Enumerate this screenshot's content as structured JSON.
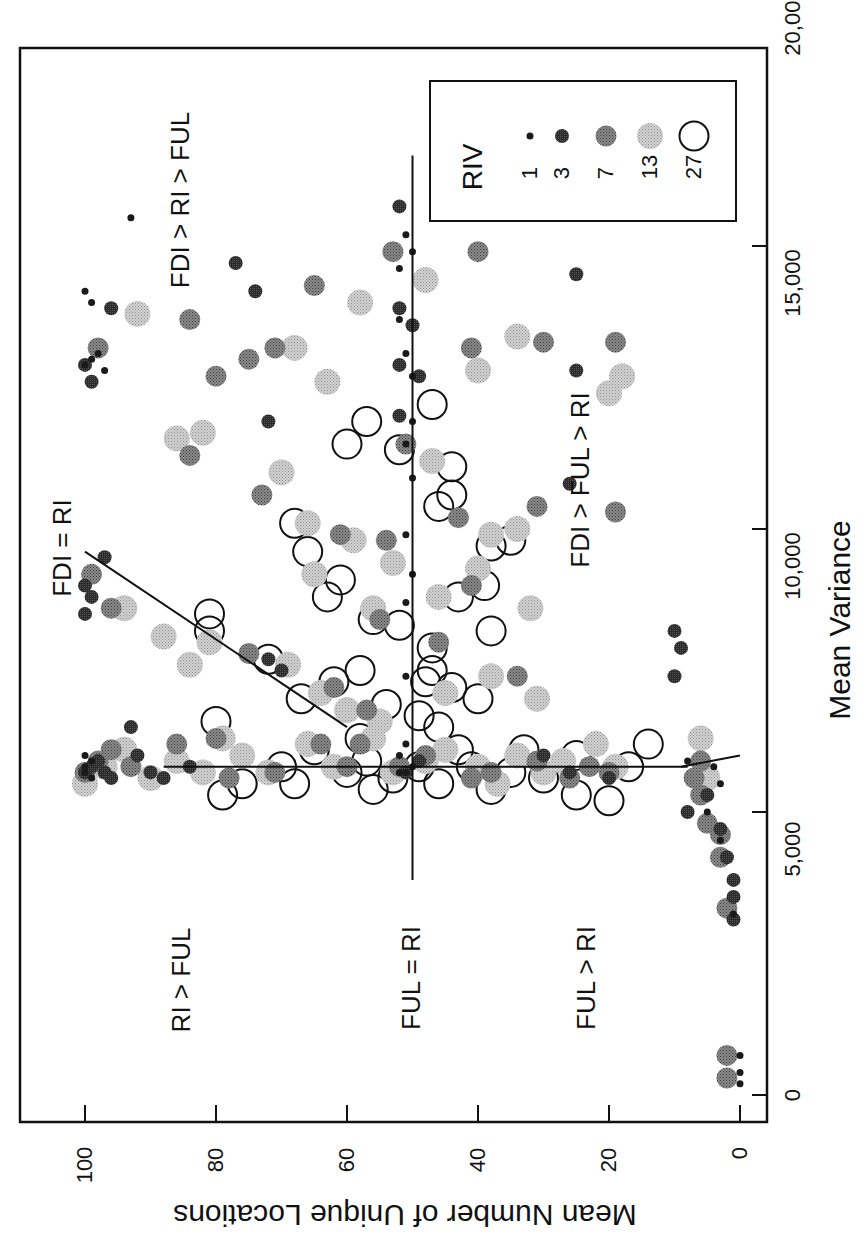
{
  "chart_data": {
    "type": "scatter",
    "orientation": "rotated-90-ccw",
    "title": "",
    "xlabel": "Mean Variance",
    "ylabel": "Mean Number of Unique Locations",
    "xlim": [
      -500,
      20000
    ],
    "ylim": [
      -5,
      105
    ],
    "xticks": [
      "0",
      "5,000",
      "10,000",
      "15,000",
      "20,000"
    ],
    "xtick_values": [
      0,
      5000,
      10000,
      15000,
      20000
    ],
    "yticks": [
      "0",
      "20",
      "40",
      "60",
      "80",
      "100"
    ],
    "ytick_values": [
      0,
      20,
      40,
      60,
      80,
      100
    ],
    "grid": false,
    "legend": {
      "title": "RIV",
      "position": "upper-right",
      "entries": [
        {
          "label": "1",
          "marker": "tiny-dark-dot",
          "color": "#1a1a1a"
        },
        {
          "label": "3",
          "marker": "small-dark-dot",
          "color": "#333333"
        },
        {
          "label": "7",
          "marker": "medium-gray-dot",
          "color": "#6a6a6a"
        },
        {
          "label": "13",
          "marker": "large-light-gray-dot",
          "color": "#b4b4b4"
        },
        {
          "label": "27",
          "marker": "large-open-circle",
          "color": "#111111"
        }
      ]
    },
    "annotations": [
      {
        "text": "FDI > RI > FUL",
        "variance": 14700,
        "locations": 90
      },
      {
        "text": "FDI = RI",
        "variance": 9000,
        "locations": 103
      },
      {
        "text": "FDI > FUL > RI",
        "variance": 10500,
        "locations": 25
      },
      {
        "text": "RI > FUL",
        "variance": 2800,
        "locations": 83
      },
      {
        "text": "FUL = RI",
        "variance": 2800,
        "locations": 50
      },
      {
        "text": "FUL > RI",
        "variance": 2800,
        "locations": 22
      }
    ],
    "reference_lines": [
      {
        "name": "FUL = RI",
        "from": {
          "variance": 3800,
          "locations": 50
        },
        "to": {
          "variance": 16600,
          "locations": 50
        }
      },
      {
        "name": "FDI = RI vertical",
        "from": {
          "variance": 6000,
          "locations": 0
        },
        "to": {
          "variance": 5800,
          "locations": 9
        }
      },
      {
        "name": "FDI boundary",
        "from": {
          "variance": 5800,
          "locations": 8
        },
        "to": {
          "variance": 5800,
          "locations": 88
        }
      },
      {
        "name": "FDI = RI diagonal",
        "from": {
          "variance": 6500,
          "locations": 60
        },
        "to": {
          "variance": 9600,
          "locations": 100
        }
      }
    ],
    "series": [
      {
        "name": "RIV 1",
        "riv": 1,
        "points": [
          [
            200,
            0
          ],
          [
            400,
            0
          ],
          [
            700,
            0
          ],
          [
            3200,
            1
          ],
          [
            4500,
            3
          ],
          [
            5000,
            5
          ],
          [
            5700,
            100
          ],
          [
            5800,
            100
          ],
          [
            5900,
            99
          ],
          [
            6000,
            100
          ],
          [
            5600,
            99
          ],
          [
            5700,
            52
          ],
          [
            5800,
            50
          ],
          [
            5700,
            51
          ],
          [
            6000,
            52
          ],
          [
            12900,
            100
          ],
          [
            13000,
            99
          ],
          [
            13100,
            98
          ],
          [
            12800,
            97
          ],
          [
            14000,
            99
          ],
          [
            14200,
            100
          ],
          [
            15500,
            93
          ],
          [
            14600,
            52
          ],
          [
            15200,
            51
          ],
          [
            14900,
            50
          ],
          [
            13700,
            52
          ],
          [
            13100,
            51
          ],
          [
            12700,
            50
          ],
          [
            11900,
            50
          ],
          [
            11500,
            51
          ],
          [
            10900,
            50
          ],
          [
            9900,
            51
          ],
          [
            9200,
            50
          ],
          [
            8700,
            51
          ],
          [
            7400,
            51
          ],
          [
            6200,
            51
          ],
          [
            5900,
            8
          ],
          [
            5500,
            3
          ],
          [
            5800,
            4
          ]
        ]
      },
      {
        "name": "RIV 3",
        "riv": 3,
        "points": [
          [
            3100,
            1
          ],
          [
            3500,
            1
          ],
          [
            3800,
            1
          ],
          [
            4200,
            2
          ],
          [
            4700,
            3
          ],
          [
            5000,
            8
          ],
          [
            5300,
            5
          ],
          [
            5700,
            100
          ],
          [
            5800,
            99
          ],
          [
            5900,
            98
          ],
          [
            5700,
            97
          ],
          [
            5600,
            96
          ],
          [
            6000,
            92
          ],
          [
            6500,
            93
          ],
          [
            5700,
            90
          ],
          [
            5600,
            88
          ],
          [
            5800,
            84
          ],
          [
            5700,
            51
          ],
          [
            5900,
            49
          ],
          [
            8200,
            10
          ],
          [
            7900,
            9
          ],
          [
            7400,
            10
          ],
          [
            12900,
            100
          ],
          [
            12600,
            99
          ],
          [
            13900,
            96
          ],
          [
            14700,
            77
          ],
          [
            14200,
            74
          ],
          [
            11900,
            72
          ],
          [
            12000,
            52
          ],
          [
            12700,
            49
          ],
          [
            13600,
            50
          ],
          [
            15700,
            52
          ],
          [
            13900,
            52
          ],
          [
            12900,
            52
          ],
          [
            10800,
            26
          ],
          [
            12800,
            25
          ],
          [
            14500,
            25
          ],
          [
            9000,
            100
          ],
          [
            8800,
            99
          ],
          [
            8500,
            100
          ],
          [
            9500,
            97
          ],
          [
            7700,
            72
          ],
          [
            7500,
            70
          ],
          [
            6000,
            30
          ],
          [
            5700,
            26
          ],
          [
            5600,
            20
          ]
        ]
      },
      {
        "name": "RIV 7",
        "riv": 7,
        "points": [
          [
            300,
            2
          ],
          [
            700,
            2
          ],
          [
            3300,
            2
          ],
          [
            4200,
            3
          ],
          [
            4600,
            3
          ],
          [
            4800,
            5
          ],
          [
            5300,
            6
          ],
          [
            5600,
            7
          ],
          [
            5900,
            6
          ],
          [
            5700,
            100
          ],
          [
            5900,
            98
          ],
          [
            6100,
            96
          ],
          [
            5800,
            93
          ],
          [
            6200,
            86
          ],
          [
            6300,
            80
          ],
          [
            5600,
            78
          ],
          [
            5700,
            71
          ],
          [
            6200,
            64
          ],
          [
            5800,
            60
          ],
          [
            6200,
            58
          ],
          [
            5800,
            52
          ],
          [
            6000,
            48
          ],
          [
            5600,
            41
          ],
          [
            5700,
            38
          ],
          [
            5900,
            31
          ],
          [
            5600,
            26
          ],
          [
            5800,
            23
          ],
          [
            5700,
            20
          ],
          [
            9200,
            99
          ],
          [
            8600,
            96
          ],
          [
            7800,
            75
          ],
          [
            7200,
            62
          ],
          [
            6800,
            57
          ],
          [
            8000,
            46
          ],
          [
            8400,
            55
          ],
          [
            7400,
            34
          ],
          [
            9000,
            41
          ],
          [
            9900,
            61
          ],
          [
            10600,
            73
          ],
          [
            11300,
            84
          ],
          [
            11500,
            51
          ],
          [
            12700,
            80
          ],
          [
            13000,
            75
          ],
          [
            13200,
            71
          ],
          [
            13200,
            98
          ],
          [
            13700,
            84
          ],
          [
            14300,
            65
          ],
          [
            14900,
            53
          ],
          [
            13200,
            41
          ],
          [
            14900,
            40
          ],
          [
            13300,
            30
          ],
          [
            13300,
            19
          ],
          [
            10400,
            31
          ],
          [
            10300,
            19
          ],
          [
            10200,
            43
          ],
          [
            9800,
            54
          ]
        ]
      },
      {
        "name": "RIV 13",
        "riv": 13,
        "points": [
          [
            5500,
            100
          ],
          [
            5800,
            97
          ],
          [
            6100,
            94
          ],
          [
            5600,
            90
          ],
          [
            5900,
            86
          ],
          [
            5700,
            82
          ],
          [
            6300,
            79
          ],
          [
            6000,
            76
          ],
          [
            5700,
            72
          ],
          [
            6200,
            66
          ],
          [
            5800,
            62
          ],
          [
            6300,
            56
          ],
          [
            5700,
            53
          ],
          [
            5900,
            48
          ],
          [
            6100,
            45
          ],
          [
            5800,
            40
          ],
          [
            5500,
            37
          ],
          [
            6000,
            34
          ],
          [
            5700,
            30
          ],
          [
            5900,
            27
          ],
          [
            6200,
            22
          ],
          [
            5800,
            19
          ],
          [
            5600,
            5
          ],
          [
            6300,
            6
          ],
          [
            8600,
            94
          ],
          [
            8100,
            88
          ],
          [
            8000,
            81
          ],
          [
            7600,
            84
          ],
          [
            7600,
            69
          ],
          [
            7100,
            64
          ],
          [
            6800,
            60
          ],
          [
            6600,
            55
          ],
          [
            7100,
            45
          ],
          [
            7400,
            38
          ],
          [
            7000,
            31
          ],
          [
            8600,
            32
          ],
          [
            9300,
            40
          ],
          [
            9400,
            53
          ],
          [
            9800,
            59
          ],
          [
            10100,
            66
          ],
          [
            11000,
            70
          ],
          [
            11700,
            82
          ],
          [
            11600,
            86
          ],
          [
            11200,
            47
          ],
          [
            12600,
            63
          ],
          [
            13200,
            68
          ],
          [
            13800,
            92
          ],
          [
            14000,
            58
          ],
          [
            14400,
            48
          ],
          [
            13400,
            34
          ],
          [
            12800,
            40
          ],
          [
            12700,
            18
          ],
          [
            12400,
            20
          ],
          [
            10000,
            34
          ],
          [
            9900,
            38
          ],
          [
            8800,
            46
          ],
          [
            8600,
            56
          ],
          [
            9200,
            65
          ]
        ]
      },
      {
        "name": "RIV 27",
        "riv": 27,
        "points": [
          [
            5300,
            79
          ],
          [
            5500,
            76
          ],
          [
            5800,
            70
          ],
          [
            5500,
            68
          ],
          [
            6100,
            65
          ],
          [
            5700,
            60
          ],
          [
            5400,
            56
          ],
          [
            5900,
            57
          ],
          [
            5600,
            53
          ],
          [
            5500,
            46
          ],
          [
            6100,
            43
          ],
          [
            5800,
            41
          ],
          [
            5400,
            38
          ],
          [
            5700,
            35
          ],
          [
            6100,
            33
          ],
          [
            5600,
            30
          ],
          [
            5300,
            25
          ],
          [
            6000,
            25
          ],
          [
            5200,
            20
          ],
          [
            5800,
            17
          ],
          [
            6200,
            14
          ],
          [
            6600,
            80
          ],
          [
            7000,
            67
          ],
          [
            7300,
            62
          ],
          [
            7500,
            58
          ],
          [
            6900,
            54
          ],
          [
            6700,
            49
          ],
          [
            6500,
            46
          ],
          [
            7200,
            44
          ],
          [
            7500,
            47
          ],
          [
            7000,
            40
          ],
          [
            7900,
            47
          ],
          [
            8300,
            52
          ],
          [
            8400,
            56
          ],
          [
            8800,
            63
          ],
          [
            9100,
            61
          ],
          [
            8200,
            81
          ],
          [
            8500,
            81
          ],
          [
            8800,
            43
          ],
          [
            8200,
            38
          ],
          [
            9000,
            39
          ],
          [
            9700,
            38
          ],
          [
            9800,
            35
          ],
          [
            10100,
            68
          ],
          [
            10400,
            46
          ],
          [
            10600,
            44
          ],
          [
            11100,
            44
          ],
          [
            11400,
            52
          ],
          [
            11500,
            60
          ],
          [
            11900,
            57
          ],
          [
            12200,
            47
          ],
          [
            9600,
            66
          ],
          [
            7700,
            72
          ],
          [
            7300,
            48
          ],
          [
            6300,
            58
          ],
          [
            5800,
            49
          ]
        ]
      }
    ]
  },
  "legend_box": {
    "title": "RIV",
    "labels": [
      "1",
      "3",
      "7",
      "13",
      "27"
    ]
  },
  "axes": {
    "x_title": "Mean Variance",
    "y_title": "Mean Number of Unique Locations",
    "x_tick_labels": [
      "0",
      "5,000",
      "10,000",
      "15,000",
      "20,000"
    ],
    "y_tick_labels": [
      "0",
      "20",
      "40",
      "60",
      "80",
      "100"
    ]
  },
  "region_labels": {
    "fdi_ri_ful": "FDI > RI > FUL",
    "fdi_eq_ri": "FDI = RI",
    "fdi_ful_ri": "FDI > FUL > RI",
    "ri_ful": "RI > FUL",
    "ful_eq_ri": "FUL = RI",
    "ful_ri": "FUL > RI"
  }
}
